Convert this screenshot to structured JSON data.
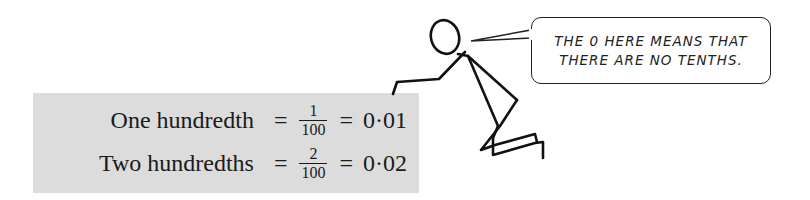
{
  "equations": [
    {
      "label": "One hundredth",
      "equals_1": "=",
      "numerator": "1",
      "denominator": "100",
      "equals_2": "=",
      "decimal": "0·01"
    },
    {
      "label": "Two hundredths",
      "equals_1": "=",
      "numerator": "2",
      "denominator": "100",
      "equals_2": "=",
      "decimal": "0·02"
    }
  ],
  "speech_bubble": {
    "lines": [
      "THE 0 HERE MEANS THAT",
      "THERE ARE NO TENTHS."
    ]
  },
  "colors": {
    "box_background": "#dcdcdc",
    "ink": "#1a1a1a"
  }
}
